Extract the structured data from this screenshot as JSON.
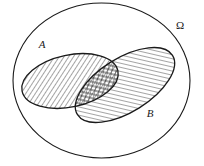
{
  "figure": {
    "kind": "set-diagram",
    "background_color": "#ffffff",
    "stroke_color": "#1a1a1a"
  },
  "labels": {
    "universe": "Ω",
    "set_a": "A",
    "set_b": "B"
  },
  "geometry": {
    "universe": {
      "cx": 101.5,
      "cy": 80.5,
      "rx": 88.5,
      "ry": 77.5,
      "rotation": 0,
      "stroke_width": 1.1,
      "fill": "none"
    },
    "set_a": {
      "cx": 70,
      "cy": 81,
      "rx": 49,
      "ry": 26,
      "rotation": -12,
      "stroke_width": 1.3,
      "hatch": "forward-slash"
    },
    "set_b": {
      "cx": 125,
      "cy": 85,
      "rx": 56,
      "ry": 27,
      "rotation": -32,
      "stroke_width": 1.3,
      "hatch": "back-slash"
    },
    "intersection": {
      "hatch": "cross-hatch"
    }
  },
  "label_positions": {
    "universe": {
      "x": 180,
      "y": 29
    },
    "set_a": {
      "x": 42,
      "y": 48
    },
    "set_b": {
      "x": 150,
      "y": 117
    }
  },
  "hatching": {
    "spacing_px": 4,
    "line_width": 0.8,
    "forward_angle_deg": 45,
    "back_angle_deg": -45
  }
}
